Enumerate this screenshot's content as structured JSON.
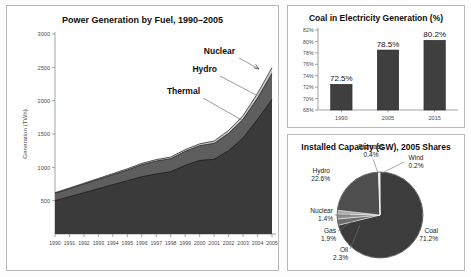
{
  "figure": {
    "background": "#fdfdfd",
    "panel_border": "#b9b9b9"
  },
  "panels": {
    "area": {
      "name": "power-generation-area-chart",
      "title": "Power Generation by Fuel, 1990–2005"
    },
    "bar": {
      "name": "coal-share-bar-chart",
      "title": "Coal in Electricity Generation (%)"
    },
    "pie": {
      "name": "installed-capacity-pie-chart",
      "title": "Installed Capacity (GW), 2005 Shares"
    }
  },
  "chart_data": [
    {
      "type": "area",
      "title": "Power Generation by Fuel, 1990–2005",
      "xlabel": "",
      "ylabel": "Generation (TWh)",
      "stacked": true,
      "grid": false,
      "legend_position": "annotations-inline",
      "x": [
        1990,
        1991,
        1992,
        1993,
        1994,
        1995,
        1996,
        1997,
        1998,
        1999,
        2000,
        2001,
        2002,
        2003,
        2004,
        2005
      ],
      "xtick_labels": [
        "1990",
        "1991",
        "1992",
        "1993",
        "1994",
        "1995",
        "1996",
        "1997",
        "1998",
        "1999",
        "2000",
        "2001",
        "2002",
        "2003",
        "2004",
        "2005"
      ],
      "ylim": [
        0,
        3000
      ],
      "ytick_labels": [
        "500",
        "1000",
        "1500",
        "2000",
        "2500",
        "3000"
      ],
      "ytick_values": [
        500,
        1000,
        1500,
        2000,
        2500,
        3000
      ],
      "series": [
        {
          "name": "Thermal",
          "color": "#3a3a3a",
          "values": [
            500,
            560,
            620,
            680,
            740,
            800,
            860,
            900,
            935,
            1030,
            1105,
            1120,
            1250,
            1440,
            1720,
            2020
          ]
        },
        {
          "name": "Hydro",
          "color": "#5e5e5e",
          "values": [
            110,
            120,
            130,
            140,
            150,
            160,
            180,
            195,
            195,
            210,
            220,
            240,
            260,
            280,
            320,
            390
          ]
        },
        {
          "name": "Nuclear",
          "color": "#c9c9c9",
          "values": [
            10,
            10,
            12,
            14,
            16,
            18,
            20,
            22,
            24,
            26,
            28,
            35,
            45,
            55,
            70,
            85
          ]
        }
      ],
      "annotations": [
        {
          "label": "Nuclear",
          "has_arrow": true
        },
        {
          "label": "Hydro",
          "has_arrow": false
        },
        {
          "label": "Thermal",
          "has_arrow": false
        }
      ]
    },
    {
      "type": "bar",
      "title": "Coal in Electricity Generation (%)",
      "xlabel": "",
      "ylabel": "",
      "grid": false,
      "categories": [
        "1990",
        "2005",
        "2015"
      ],
      "values": [
        72.5,
        78.5,
        80.2
      ],
      "value_labels": [
        "72.5%",
        "78.5%",
        "80.2%"
      ],
      "ylim": [
        68,
        82
      ],
      "ytick_values": [
        68,
        70,
        72,
        74,
        76,
        78,
        80,
        82
      ],
      "ytick_labels": [
        "68%",
        "70%",
        "72%",
        "74%",
        "76%",
        "78%",
        "80%",
        "82%"
      ],
      "bar_color": "#3f3f3f"
    },
    {
      "type": "pie",
      "title": "Installed Capacity (GW), 2005 Shares",
      "legend_position": "outside-labels",
      "labels": [
        "Coal",
        "Hydro",
        "Biomass",
        "Wind",
        "Nuclear",
        "Gas",
        "Oil"
      ],
      "values": [
        71.2,
        22.6,
        0.4,
        0.2,
        1.4,
        1.9,
        2.3
      ],
      "label_texts": [
        "Coal\n71.2%",
        "Hydro\n22.6%",
        "Biomass\n0.4%",
        "Wind\n0.2%",
        "Nuclear\n1.4%",
        "Gas\n1.9%",
        "Oil\n2.3%"
      ],
      "slices": [
        {
          "name": "Coal",
          "value": 71.2,
          "label": "Coal",
          "percent": "71.2%",
          "color": "#3c3c3c"
        },
        {
          "name": "Hydro",
          "value": 22.6,
          "label": "Hydro",
          "percent": "22.6%",
          "color": "#4e4e4e"
        },
        {
          "name": "Biomass",
          "value": 0.4,
          "label": "Biomass",
          "percent": "0.4%",
          "color": "#d8d8d8"
        },
        {
          "name": "Wind",
          "value": 0.2,
          "label": "Wind",
          "percent": "0.2%",
          "color": "#ededed"
        },
        {
          "name": "Nuclear",
          "value": 1.4,
          "label": "Nuclear",
          "percent": "1.4%",
          "color": "#a8a8a8"
        },
        {
          "name": "Gas",
          "value": 1.9,
          "label": "Gas",
          "percent": "1.9%",
          "color": "#8f8f8f"
        },
        {
          "name": "Oil",
          "value": 2.3,
          "label": "Oil",
          "percent": "2.3%",
          "color": "#6e6e6e"
        }
      ]
    }
  ]
}
